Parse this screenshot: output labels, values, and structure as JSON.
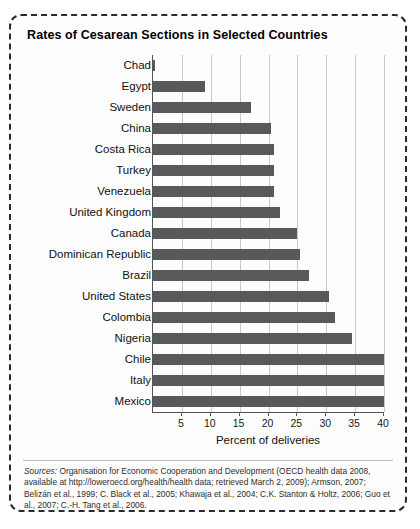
{
  "figure": {
    "title": "Rates of Cesarean Sections in Selected Countries",
    "sources_lead": "Sources:",
    "sources_text": " Organisation for Economic Cooperation and Development (OECD health data 2008, available at http://loweroecd.org/health/health data; retrieved March 2, 2009); Armson, 2007; Belizán et al., 1999; C. Black et al., 2005; Khawaja et al., 2004; C.K. Stanton & Holtz, 2006; Guo et al., 2007; C.-H. Tang et al., 2006."
  },
  "chart_data": {
    "type": "bar",
    "orientation": "horizontal",
    "title": "Rates of Cesarean Sections in Selected Countries",
    "xlabel": "Percent of deliveries",
    "ylabel": "",
    "xlim": [
      0,
      40
    ],
    "xticks": [
      5,
      10,
      15,
      20,
      25,
      30,
      35,
      40
    ],
    "grid": true,
    "legend": "none",
    "bar_color": "#595959",
    "categories": [
      "Chad",
      "Egypt",
      "Sweden",
      "China",
      "Costa Rica",
      "Turkey",
      "Venezuela",
      "United Kingdom",
      "Canada",
      "Dominican Republic",
      "Brazil",
      "United States",
      "Colombia",
      "Nigeria",
      "Chile",
      "Italy",
      "Mexico"
    ],
    "values": [
      0.4,
      9.0,
      17.0,
      20.5,
      21.0,
      21.0,
      21.0,
      22.0,
      25.0,
      25.5,
      27.0,
      30.5,
      31.5,
      34.5,
      40.0,
      40.0,
      40.0
    ]
  }
}
